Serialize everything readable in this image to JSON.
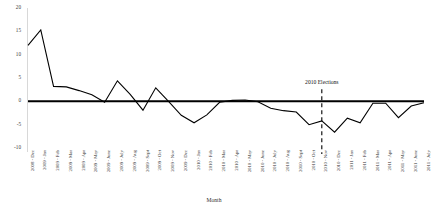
{
  "chart_data": {
    "type": "line",
    "title": "",
    "xlabel": "Month",
    "ylabel": "",
    "ylim": [
      -10,
      20
    ],
    "yticks": [
      20,
      15,
      10,
      5,
      0,
      -5,
      -10
    ],
    "grid": false,
    "legend": null,
    "zero_line": 0,
    "categories": [
      "2008 - Dec",
      "2009 - Jan",
      "2009 - Feb",
      "2009 - Mar",
      "2009 - Apr",
      "2009 - May",
      "2009 - June",
      "2009 - July",
      "2009 - Aug",
      "2009 - Sept",
      "2009 - Oct",
      "2009 - Nov",
      "2009 - Dec",
      "2010 - Jan",
      "2010 - Feb",
      "2010 - Mar",
      "2010 - Apr",
      "2010 - May",
      "2010 - June",
      "2010 - July",
      "2010 - Aug",
      "2010 - Sept",
      "2010 - Oct",
      "2010 - Nov",
      "2010 - Dec",
      "2011 - Jan",
      "2011 - Feb",
      "2011 - Mar",
      "2011 - Apr",
      "2011 - May",
      "2011 - June",
      "2011 - July"
    ],
    "series": [
      {
        "name": "Monthly change",
        "values": [
          12.0,
          15.3,
          3.2,
          3.1,
          2.3,
          1.4,
          -0.2,
          4.4,
          1.5,
          -1.9,
          2.9,
          0.0,
          -3.0,
          -4.6,
          -2.9,
          -0.2,
          0.2,
          0.3,
          -0.1,
          -1.5,
          -2.0,
          -2.3,
          -5.0,
          -4.2,
          -6.6,
          -3.6,
          -4.6,
          -0.4,
          -0.4,
          -3.5,
          -1.0,
          -0.3
        ]
      }
    ],
    "annotations": [
      {
        "label": "2010 Elections",
        "at_category": "2010 - Nov",
        "style": "dashed-vertical-line"
      }
    ],
    "colors": {
      "line": "#000000",
      "zero_axis": "#000000",
      "annotation_line": "#000000",
      "tick_text": "#2e2e2e",
      "axis_rule": "#d8d8d8"
    }
  }
}
